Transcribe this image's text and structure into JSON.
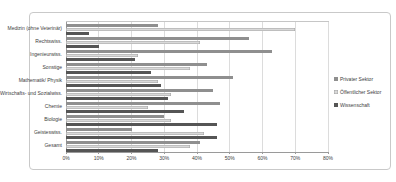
{
  "chart_data": {
    "type": "bar",
    "orientation": "horizontal",
    "title": "",
    "xlabel": "",
    "ylabel": "",
    "xlim": [
      0,
      80
    ],
    "x_tick_labels": [
      "0%",
      "10%",
      "20%",
      "30%",
      "40%",
      "50%",
      "60%",
      "70%",
      "80%"
    ],
    "gridlines": true,
    "legend_position": "right",
    "categories": [
      "Medizin (ohne Veterinär)",
      "Rechtswiss.",
      "Ingenieurwiss.",
      "Sonstige",
      "Mathematik/ Physik",
      "Wirtschafts- und Sozialwiss.",
      "Chemie",
      "Biologie",
      "Geisteswiss.",
      "Gesamt"
    ],
    "series": [
      {
        "name": "Privater Sektor",
        "color": "#8f8f8f",
        "values": [
          28,
          56,
          63,
          43,
          51,
          45,
          47,
          30,
          20,
          41
        ]
      },
      {
        "name": "Öffentlicher Sektor",
        "color": "#d9d9d9",
        "values": [
          70,
          41,
          22,
          38,
          28,
          32,
          25,
          32,
          42,
          38
        ]
      },
      {
        "name": "Wissenschaft",
        "color": "#555555",
        "values": [
          7,
          10,
          21,
          26,
          29,
          31,
          36,
          46,
          46,
          28
        ]
      }
    ]
  },
  "frame": {
    "background": "#ffffff",
    "border_color": "#c9c9c9"
  }
}
